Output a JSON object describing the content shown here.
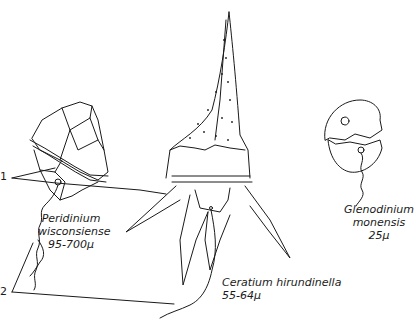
{
  "diagram": {
    "ink_color": "#1a1a1a",
    "background": "#ffffff",
    "callouts": [
      {
        "number": "1",
        "meaning_hint": "girdle (transverse groove)"
      },
      {
        "number": "2",
        "meaning_hint": "flagellum"
      }
    ],
    "organisms": [
      {
        "id": "peridinium",
        "name_line1": "Peridinium",
        "name_line2": "wisconsiense",
        "size": "95-700μ"
      },
      {
        "id": "ceratium",
        "name_line1": "Ceratium hirundinella",
        "size": "55-64μ"
      },
      {
        "id": "glenodinium",
        "name_line1": "Glenodinium",
        "name_line2": "monensis",
        "size": "25μ"
      }
    ]
  }
}
